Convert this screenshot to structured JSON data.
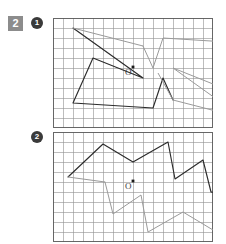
{
  "exercise": {
    "number": "2"
  },
  "items": [
    {
      "bullet": "1",
      "center_label": "O",
      "grid": {
        "cols": 16,
        "rows": 11,
        "cell": 10
      },
      "figure_type": "point-symmetric-star",
      "original_path": "20,10 90,60 40,40 20,85 100,90 110,60 120,82",
      "image_path": "190,100 120,50 170,70 190,25 110,20 100,50 90,28"
    },
    {
      "bullet": "2",
      "center_label": "O",
      "grid": {
        "cols": 16,
        "rows": 11,
        "cell": 10
      },
      "figure_type": "point-symmetric-blob",
      "original_path": "15,45 50,12 80,30 115,10 122,47 150,28 158,60",
      "image_path": "195,65 160,98 130,80 95,100 88,63 60,82 52,50"
    }
  ],
  "colors": {
    "chip_background": "#8c8c8c",
    "chip_text": "#ffffff",
    "bullet_background": "#3a3a3a",
    "bullet_text": "#ffffff",
    "grid_minor": "#8f8f8f",
    "grid_major": "#6a6a6a",
    "grid_border": "#555555",
    "figure_original": "#2b2b2b",
    "figure_image": "#9a9a9a",
    "center_dot": "#1a1a1a",
    "page_background": "#ffffff"
  }
}
